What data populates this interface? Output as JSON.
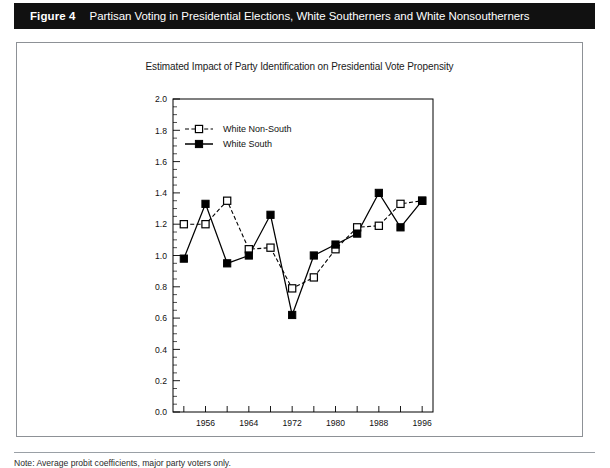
{
  "header": {
    "figure_label": "Figure 4",
    "figure_title": "Partisan Voting in Presidential Elections, White Southerners and White Nonsoutherners"
  },
  "note": {
    "text": "Note: Average probit coefficients, major party voters only."
  },
  "chart_data": {
    "type": "line",
    "title": "Estimated Impact of Party Identification on Presidential Vote Propensity",
    "xlabel": "",
    "ylabel": "",
    "xlim": [
      1950,
      1998
    ],
    "ylim": [
      0.0,
      2.0
    ],
    "grid": false,
    "legend_position": "top-left-inside",
    "x": [
      1952,
      1956,
      1960,
      1964,
      1968,
      1972,
      1976,
      1980,
      1984,
      1988,
      1992,
      1996
    ],
    "xticks": [
      1952,
      1956,
      1960,
      1964,
      1968,
      1972,
      1976,
      1980,
      1984,
      1988,
      1992,
      1996
    ],
    "xtick_labels": [
      "",
      "1956",
      "",
      "1964",
      "",
      "1972",
      "",
      "1980",
      "",
      "1988",
      "",
      "1996"
    ],
    "yticks": [
      0.0,
      0.2,
      0.4,
      0.6,
      0.8,
      1.0,
      1.2,
      1.4,
      1.6,
      1.8,
      2.0
    ],
    "ytick_labels": [
      "0.0",
      "0.2",
      "0.4",
      "0.6",
      "0.8",
      "1.0",
      "1.2",
      "1.4",
      "1.6",
      "1.8",
      "2.0"
    ],
    "yminor_step": 0.05,
    "series": [
      {
        "name": "White Non-South",
        "marker": "open-square",
        "line": "dashed",
        "color": "#000000",
        "values": [
          1.2,
          1.2,
          1.35,
          1.04,
          1.05,
          0.79,
          0.86,
          1.04,
          1.18,
          1.19,
          1.33,
          1.35
        ]
      },
      {
        "name": "White South",
        "marker": "filled-square",
        "line": "solid",
        "color": "#000000",
        "values": [
          0.98,
          1.33,
          0.95,
          1.0,
          1.26,
          0.62,
          1.0,
          1.07,
          1.14,
          1.4,
          1.18,
          1.35
        ]
      }
    ]
  }
}
